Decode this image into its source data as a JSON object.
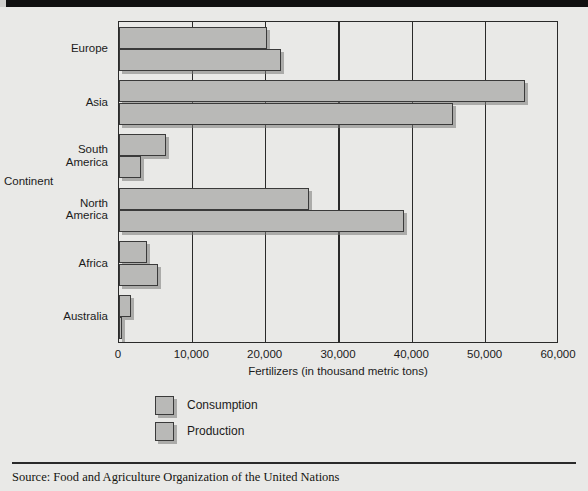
{
  "chart_data": {
    "type": "bar",
    "orientation": "horizontal",
    "title": "",
    "xlabel": "Fertilizers (in thousand metric tons)",
    "ylabel": "Continent",
    "categories": [
      "Europe",
      "Asia",
      "South America",
      "North America",
      "Africa",
      "Australia"
    ],
    "category_labels_wrapped": [
      [
        "Europe"
      ],
      [
        "Asia"
      ],
      [
        "South",
        "America"
      ],
      [
        "North",
        "America"
      ],
      [
        "Africa"
      ],
      [
        "Australia"
      ]
    ],
    "series": [
      {
        "name": "Consumption",
        "values": [
          20200,
          55400,
          6400,
          25900,
          3800,
          1600
        ]
      },
      {
        "name": "Production",
        "values": [
          22100,
          45500,
          3000,
          38900,
          5300,
          400
        ]
      }
    ],
    "xlim": [
      0,
      60000
    ],
    "xticks": [
      0,
      10000,
      20000,
      30000,
      40000,
      50000,
      60000
    ],
    "xticklabels": [
      "0",
      "10,000",
      "20,000",
      "30,000",
      "40,000",
      "50,000",
      "60,000"
    ],
    "grid": "vertical",
    "legend_position": "below-axis-left",
    "bar_color": "#b9b9b7",
    "bar_edge_color": "#3a3a3a",
    "background_color": "#e9e9e7",
    "axis_color": "#2a2a2a"
  },
  "legend": {
    "entries": [
      {
        "label": "Consumption"
      },
      {
        "label": "Production"
      }
    ]
  },
  "footer": {
    "source": "Source: Food and Agriculture Organization of the United Nations"
  }
}
